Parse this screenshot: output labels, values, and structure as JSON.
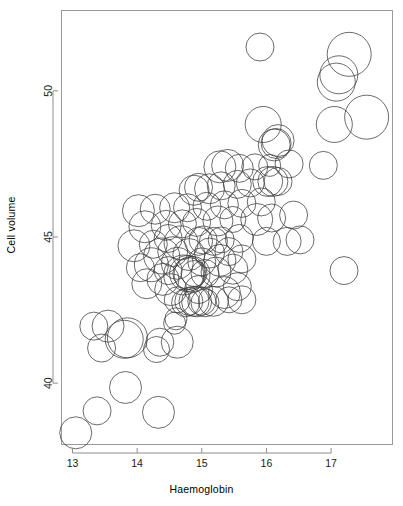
{
  "chart_data": {
    "type": "scatter",
    "title": "",
    "xlabel": "Haemoglobin",
    "ylabel": "Cell volume",
    "xlim": [
      12.83,
      17.95
    ],
    "ylim": [
      37.9,
      52.75
    ],
    "xticks": [
      13,
      14,
      15,
      16,
      17
    ],
    "yticks": [
      40,
      45,
      50
    ],
    "grid": false,
    "legend": null,
    "marker": "open-circle",
    "marker_color": "#3a3a3a",
    "background": "#ffffff",
    "size_encoding": "bubble radius encodes a third variable (white cell count)",
    "points": [
      {
        "x": 13.05,
        "y": 38.3,
        "r": 16
      },
      {
        "x": 13.38,
        "y": 39.05,
        "r": 14
      },
      {
        "x": 14.33,
        "y": 39.0,
        "r": 16
      },
      {
        "x": 13.82,
        "y": 39.85,
        "r": 16
      },
      {
        "x": 13.45,
        "y": 41.2,
        "r": 14
      },
      {
        "x": 14.3,
        "y": 41.15,
        "r": 13
      },
      {
        "x": 13.33,
        "y": 41.95,
        "r": 14
      },
      {
        "x": 13.55,
        "y": 41.95,
        "r": 16
      },
      {
        "x": 13.85,
        "y": 41.55,
        "r": 20
      },
      {
        "x": 13.8,
        "y": 41.5,
        "r": 19
      },
      {
        "x": 14.35,
        "y": 41.4,
        "r": 14
      },
      {
        "x": 14.62,
        "y": 41.4,
        "r": 16
      },
      {
        "x": 14.6,
        "y": 42.2,
        "r": 11
      },
      {
        "x": 14.75,
        "y": 42.75,
        "r": 14
      },
      {
        "x": 14.8,
        "y": 42.8,
        "r": 14
      },
      {
        "x": 14.88,
        "y": 42.8,
        "r": 15
      },
      {
        "x": 15.0,
        "y": 42.8,
        "r": 14
      },
      {
        "x": 15.18,
        "y": 42.8,
        "r": 15
      },
      {
        "x": 14.62,
        "y": 42.85,
        "r": 13
      },
      {
        "x": 15.42,
        "y": 42.85,
        "r": 13
      },
      {
        "x": 15.62,
        "y": 42.85,
        "r": 14
      },
      {
        "x": 15.35,
        "y": 43.1,
        "r": 16
      },
      {
        "x": 14.52,
        "y": 43.2,
        "r": 16
      },
      {
        "x": 14.95,
        "y": 43.2,
        "r": 14
      },
      {
        "x": 15.55,
        "y": 43.3,
        "r": 14
      },
      {
        "x": 14.15,
        "y": 43.4,
        "r": 15
      },
      {
        "x": 14.4,
        "y": 43.55,
        "r": 16
      },
      {
        "x": 14.72,
        "y": 43.7,
        "r": 20
      },
      {
        "x": 14.78,
        "y": 43.75,
        "r": 18
      },
      {
        "x": 14.8,
        "y": 43.75,
        "r": 16
      },
      {
        "x": 14.88,
        "y": 43.75,
        "r": 13
      },
      {
        "x": 15.05,
        "y": 43.75,
        "r": 14
      },
      {
        "x": 15.22,
        "y": 43.8,
        "r": 15
      },
      {
        "x": 14.48,
        "y": 43.85,
        "r": 14
      },
      {
        "x": 15.48,
        "y": 43.9,
        "r": 15
      },
      {
        "x": 14.05,
        "y": 43.95,
        "r": 14
      },
      {
        "x": 14.22,
        "y": 44.05,
        "r": 17
      },
      {
        "x": 14.62,
        "y": 44.1,
        "r": 16
      },
      {
        "x": 15.0,
        "y": 44.15,
        "r": 14
      },
      {
        "x": 15.28,
        "y": 44.2,
        "r": 16
      },
      {
        "x": 15.62,
        "y": 44.25,
        "r": 14
      },
      {
        "x": 14.38,
        "y": 44.35,
        "r": 18
      },
      {
        "x": 14.8,
        "y": 44.4,
        "r": 16
      },
      {
        "x": 15.12,
        "y": 44.45,
        "r": 15
      },
      {
        "x": 14.55,
        "y": 44.5,
        "r": 15
      },
      {
        "x": 15.42,
        "y": 44.5,
        "r": 14
      },
      {
        "x": 13.95,
        "y": 44.7,
        "r": 16
      },
      {
        "x": 14.25,
        "y": 44.75,
        "r": 14
      },
      {
        "x": 14.68,
        "y": 44.8,
        "r": 17
      },
      {
        "x": 14.95,
        "y": 44.85,
        "r": 14
      },
      {
        "x": 15.18,
        "y": 44.85,
        "r": 14
      },
      {
        "x": 15.02,
        "y": 44.9,
        "r": 14
      },
      {
        "x": 15.3,
        "y": 44.9,
        "r": 13
      },
      {
        "x": 14.48,
        "y": 44.95,
        "r": 14
      },
      {
        "x": 15.58,
        "y": 44.95,
        "r": 14
      },
      {
        "x": 16.0,
        "y": 44.85,
        "r": 14
      },
      {
        "x": 16.32,
        "y": 44.85,
        "r": 14
      },
      {
        "x": 16.52,
        "y": 44.9,
        "r": 14
      },
      {
        "x": 14.12,
        "y": 45.35,
        "r": 16
      },
      {
        "x": 14.45,
        "y": 45.4,
        "r": 15
      },
      {
        "x": 14.7,
        "y": 45.45,
        "r": 14
      },
      {
        "x": 14.92,
        "y": 45.5,
        "r": 14
      },
      {
        "x": 15.25,
        "y": 45.55,
        "r": 15
      },
      {
        "x": 15.48,
        "y": 45.6,
        "r": 13
      },
      {
        "x": 15.85,
        "y": 45.6,
        "r": 16
      },
      {
        "x": 16.08,
        "y": 45.65,
        "r": 14
      },
      {
        "x": 16.42,
        "y": 45.75,
        "r": 14
      },
      {
        "x": 14.02,
        "y": 45.9,
        "r": 16
      },
      {
        "x": 14.28,
        "y": 45.95,
        "r": 15
      },
      {
        "x": 14.58,
        "y": 46.0,
        "r": 15
      },
      {
        "x": 14.78,
        "y": 46.0,
        "r": 14
      },
      {
        "x": 15.08,
        "y": 46.05,
        "r": 14
      },
      {
        "x": 15.35,
        "y": 46.1,
        "r": 14
      },
      {
        "x": 15.62,
        "y": 46.15,
        "r": 14
      },
      {
        "x": 15.92,
        "y": 46.2,
        "r": 14
      },
      {
        "x": 14.88,
        "y": 46.6,
        "r": 15
      },
      {
        "x": 15.12,
        "y": 46.65,
        "r": 15
      },
      {
        "x": 14.95,
        "y": 46.7,
        "r": 14
      },
      {
        "x": 15.3,
        "y": 46.75,
        "r": 14
      },
      {
        "x": 15.55,
        "y": 46.8,
        "r": 14
      },
      {
        "x": 15.75,
        "y": 46.85,
        "r": 14
      },
      {
        "x": 16.02,
        "y": 46.9,
        "r": 15
      },
      {
        "x": 16.1,
        "y": 46.9,
        "r": 15
      },
      {
        "x": 16.18,
        "y": 46.9,
        "r": 14
      },
      {
        "x": 15.28,
        "y": 47.4,
        "r": 16
      },
      {
        "x": 15.4,
        "y": 47.45,
        "r": 16
      },
      {
        "x": 15.58,
        "y": 47.35,
        "r": 14
      },
      {
        "x": 15.82,
        "y": 47.4,
        "r": 13
      },
      {
        "x": 16.05,
        "y": 47.45,
        "r": 11
      },
      {
        "x": 16.35,
        "y": 47.5,
        "r": 14
      },
      {
        "x": 16.88,
        "y": 47.45,
        "r": 14
      },
      {
        "x": 16.12,
        "y": 48.15,
        "r": 16
      },
      {
        "x": 16.18,
        "y": 48.3,
        "r": 16
      },
      {
        "x": 16.15,
        "y": 48.2,
        "r": 15
      },
      {
        "x": 15.95,
        "y": 48.85,
        "r": 18
      },
      {
        "x": 17.05,
        "y": 48.85,
        "r": 18
      },
      {
        "x": 17.55,
        "y": 49.1,
        "r": 22
      },
      {
        "x": 17.08,
        "y": 50.3,
        "r": 19
      },
      {
        "x": 17.12,
        "y": 50.55,
        "r": 19
      },
      {
        "x": 17.28,
        "y": 51.25,
        "r": 22
      },
      {
        "x": 15.9,
        "y": 51.5,
        "r": 14
      },
      {
        "x": 17.2,
        "y": 43.85,
        "r": 14
      },
      {
        "x": 14.58,
        "y": 42.05,
        "r": 11
      },
      {
        "x": 14.85,
        "y": 43.72,
        "r": 18
      },
      {
        "x": 15.05,
        "y": 42.75,
        "r": 14
      },
      {
        "x": 14.92,
        "y": 42.78,
        "r": 15
      }
    ]
  },
  "axes": {
    "x_tick_labels": [
      "13",
      "14",
      "15",
      "16",
      "17"
    ],
    "y_tick_labels": [
      "40",
      "45",
      "50"
    ]
  }
}
